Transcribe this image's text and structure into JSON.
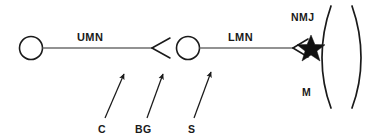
{
  "diagram": {
    "background_color": "#ffffff",
    "ink_color": "#1a1a1a",
    "axon_color": "#6e6e6e",
    "arrow_color": "#1a1a1a",
    "labels": {
      "umn": "UMN",
      "lmn": "LMN",
      "nmj": "NMJ",
      "muscle": "M",
      "cortex": "C",
      "basal_ganglia": "BG",
      "spinal_cord": "S"
    },
    "elements": {
      "upper_soma": "upper-motor-neuron-cell-body",
      "upper_axon": "upper-motor-neuron-axon",
      "upper_terminal": "upper-motor-neuron-terminal",
      "lower_soma": "lower-motor-neuron-cell-body",
      "lower_axon": "lower-motor-neuron-axon",
      "lower_terminal": "lower-motor-neuron-terminal",
      "synapse_star": "neuromuscular-junction-star",
      "muscle_shape": "muscle-fiber-lens"
    },
    "annotation_arrows": [
      {
        "name": "arrow-to-cortex",
        "label": "C",
        "from_x": 105,
        "from_y": 118,
        "to_x": 124,
        "to_y": 74
      },
      {
        "name": "arrow-to-basal-ganglia",
        "label": "BG",
        "from_x": 147,
        "from_y": 118,
        "to_x": 163,
        "to_y": 74
      },
      {
        "name": "arrow-to-spinal-cord",
        "label": "S",
        "from_x": 194,
        "from_y": 118,
        "to_x": 211,
        "to_y": 72
      }
    ]
  }
}
